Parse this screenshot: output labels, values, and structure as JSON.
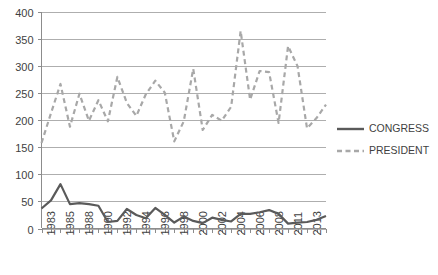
{
  "chart_data": {
    "type": "line",
    "title": "",
    "subtitle": "",
    "xlabel": "",
    "ylabel": "",
    "ylim": [
      0,
      400
    ],
    "y_ticks": [
      0,
      50,
      100,
      150,
      200,
      250,
      300,
      350,
      400
    ],
    "grid": true,
    "legend_position": "right",
    "x_tick_labels": [
      "1983",
      "1985",
      "1988",
      "1990",
      "1992",
      "1994",
      "1996",
      "1998",
      "2000",
      "2002",
      "2004",
      "2006",
      "2008",
      "2011",
      "2013"
    ],
    "x": [
      1983,
      1984,
      1985,
      1986,
      1987,
      1988,
      1989,
      1990,
      1991,
      1992,
      1993,
      1994,
      1995,
      1996,
      1997,
      1998,
      1999,
      2000,
      2001,
      2002,
      2003,
      2004,
      2005,
      2006,
      2007,
      2008,
      2009,
      2010,
      2011,
      2012,
      2013
    ],
    "series": [
      {
        "name": "CONGRESS",
        "style": "solid",
        "color": "#5a5a5a",
        "values": [
          37,
          52,
          82,
          45,
          47,
          45,
          42,
          12,
          14,
          36,
          25,
          19,
          38,
          25,
          11,
          22,
          14,
          10,
          20,
          16,
          13,
          27,
          27,
          30,
          34,
          27,
          9,
          11,
          12,
          16,
          23
        ]
      },
      {
        "name": "PRESIDENT",
        "style": "dashed",
        "color": "#a8a8a8",
        "values": [
          158,
          213,
          267,
          188,
          249,
          199,
          237,
          198,
          280,
          232,
          208,
          248,
          273,
          251,
          161,
          198,
          295,
          182,
          210,
          199,
          225,
          365,
          238,
          291,
          289,
          195,
          337,
          300,
          185,
          204,
          229
        ]
      }
    ]
  },
  "legend": {
    "entries": [
      {
        "label": "CONGRESS"
      },
      {
        "label": "PRESIDENT"
      }
    ]
  },
  "colors": {
    "congress": "#5a5a5a",
    "president": "#a8a8a8",
    "grid": "#aeaeae",
    "axis": "#8c8c8c",
    "text": "#3f3f3f",
    "background": "#ffffff"
  }
}
